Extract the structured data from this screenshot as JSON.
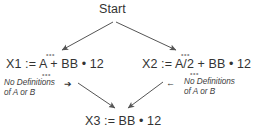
{
  "diagram": {
    "type": "control-flow-dataflow-graph",
    "background_color": "#ffffff",
    "text_color": "#333333",
    "edge_color": "#555555",
    "nodes": [
      {
        "id": "start",
        "label": "Start"
      },
      {
        "id": "x1",
        "label": "X1 := A + BB • 12"
      },
      {
        "id": "x2",
        "label": "X2 := A/2 + BB • 12"
      },
      {
        "id": "x3",
        "label": "X3 := BB • 12"
      }
    ],
    "annotations": [
      {
        "id": "left-note",
        "line1": "No Definitions",
        "line2": "of A or B",
        "pointer_icon": "right-arrow-icon",
        "pointer_glyph": "➔"
      },
      {
        "id": "right-note",
        "line1": "No Definitions",
        "line2": "of A or B",
        "pointer_icon": "left-arrow-icon",
        "pointer_glyph": "←"
      }
    ],
    "edges": [
      {
        "from": "start",
        "to": "x1",
        "arrowhead": true
      },
      {
        "from": "start",
        "to": "x2",
        "arrowhead": true
      },
      {
        "from": "x1",
        "to": "x3",
        "arrowhead": true
      },
      {
        "from": "x2",
        "to": "x3",
        "arrowhead": true
      }
    ],
    "marks": {
      "ellipsis": "•••"
    }
  }
}
